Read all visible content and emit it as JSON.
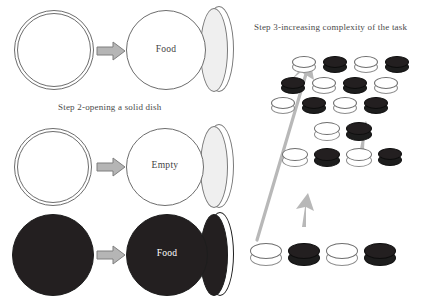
{
  "figure": {
    "background_color": "#ffffff"
  },
  "left_panel": {
    "caption": "Step 2-opening a solid dish",
    "rows": [
      {
        "id": "row-1",
        "closed_dish": {
          "style": "light",
          "label": ""
        },
        "arrow": "right-arrow",
        "open_dish": {
          "style": "light",
          "label": "Food"
        }
      },
      {
        "id": "row-2",
        "closed_dish": {
          "style": "light",
          "label": ""
        },
        "arrow": "right-arrow",
        "open_dish": {
          "style": "light",
          "label": "Empty"
        }
      },
      {
        "id": "row-3",
        "closed_dish": {
          "style": "dark",
          "label": ""
        },
        "arrow": "right-arrow",
        "open_dish": {
          "style": "dark",
          "label": "Food"
        }
      }
    ]
  },
  "right_panel": {
    "title": "Step 3-increasing complexity of the task",
    "big_arrow": {
      "name": "complexity-arrow",
      "direction": "up-right"
    },
    "small_arrows": [
      {
        "name": "progress-arrow-lower",
        "direction": "up"
      },
      {
        "name": "progress-arrow-upper",
        "direction": "up"
      }
    ],
    "groups": [
      {
        "id": "group-easy",
        "rows": [
          [
            "light",
            "dark",
            "light",
            "dark"
          ]
        ]
      },
      {
        "id": "group-medium",
        "rows": [
          [
            "light",
            "dark"
          ],
          [
            "light",
            "dark",
            "light",
            "dark"
          ]
        ]
      },
      {
        "id": "group-hard",
        "rows": [
          [
            "light",
            "dark",
            "light",
            "dark"
          ],
          [
            "dark",
            "light",
            "dark",
            "light"
          ],
          [
            "light",
            "dark",
            "light",
            "dark"
          ]
        ]
      }
    ]
  },
  "colors": {
    "dark_dish": "#231f20",
    "light_dish": "#ffffff",
    "outline": "#6d6d6d",
    "arrow_fill": "#b5b5b5",
    "arrow_stroke": "#808080",
    "text": "#4a4a4a"
  }
}
